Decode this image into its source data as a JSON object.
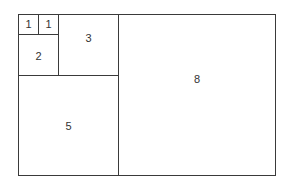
{
  "diagram": {
    "title": "",
    "type": "fibonacci-squares",
    "squares": [
      {
        "label": "1",
        "x": 18,
        "y": 14,
        "w": 21,
        "h": 21,
        "label_dx": 0,
        "label_dy": -1
      },
      {
        "label": "1",
        "x": 38,
        "y": 14,
        "w": 21,
        "h": 21,
        "label_dx": 0,
        "label_dy": -1
      },
      {
        "label": "2",
        "x": 18,
        "y": 34,
        "w": 41,
        "h": 42,
        "label_dx": 0,
        "label_dy": 1
      },
      {
        "label": "3",
        "x": 58,
        "y": 14,
        "w": 61,
        "h": 62,
        "label_dx": 0,
        "label_dy": -7
      },
      {
        "label": "5",
        "x": 18,
        "y": 75,
        "w": 101,
        "h": 101,
        "label_dx": 0,
        "label_dy": 0
      },
      {
        "label": "8",
        "x": 118,
        "y": 14,
        "w": 158,
        "h": 162,
        "label_dx": 0,
        "label_dy": -16
      }
    ]
  }
}
